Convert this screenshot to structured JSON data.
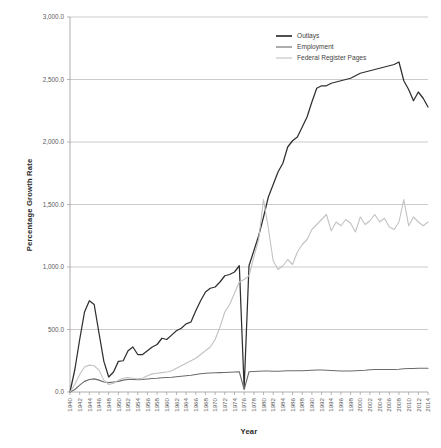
{
  "chart_data": {
    "type": "line",
    "title": "",
    "xlabel": "Year",
    "ylabel": "Percentage Growth Rate",
    "xlim": [
      1940,
      2014
    ],
    "ylim": [
      0,
      3000
    ],
    "grid": true,
    "legend_position": "top-center",
    "ytick_labels": [
      "0.0",
      "500.0",
      "1,000.0",
      "1,500.0",
      "2,000.0",
      "2,500.0",
      "3,000.0"
    ],
    "ytick_values": [
      0,
      500,
      1000,
      1500,
      2000,
      2500,
      3000
    ],
    "xtick_labels": [
      "1940",
      "1942",
      "1944",
      "1946",
      "1948",
      "1950",
      "1952",
      "1954",
      "1956",
      "1958",
      "1960",
      "1962",
      "1964",
      "1966",
      "1968",
      "1970",
      "1972",
      "1974",
      "1976",
      "1978",
      "1980",
      "1982",
      "1984",
      "1986",
      "1988",
      "1990",
      "1992",
      "1994",
      "1996",
      "1998",
      "2000",
      "2002",
      "2004",
      "2006",
      "2008",
      "2010",
      "2012",
      "2014"
    ],
    "x": [
      1940,
      1941,
      1942,
      1943,
      1944,
      1945,
      1946,
      1947,
      1948,
      1949,
      1950,
      1951,
      1952,
      1953,
      1954,
      1955,
      1956,
      1957,
      1958,
      1959,
      1960,
      1961,
      1962,
      1963,
      1964,
      1965,
      1966,
      1967,
      1968,
      1969,
      1970,
      1971,
      1972,
      1973,
      1974,
      1975,
      1976,
      1977,
      1978,
      1979,
      1980,
      1981,
      1982,
      1983,
      1984,
      1985,
      1986,
      1987,
      1988,
      1989,
      1990,
      1991,
      1992,
      1993,
      1994,
      1995,
      1996,
      1997,
      1998,
      1999,
      2000,
      2001,
      2002,
      2003,
      2004,
      2005,
      2006,
      2007,
      2008,
      2009,
      2010,
      2011,
      2012,
      2013,
      2014
    ],
    "series": [
      {
        "name": "Outlays",
        "color": "#2f2f2f",
        "width": 1.25,
        "values": [
          0,
          180,
          420,
          640,
          730,
          700,
          470,
          245,
          120,
          160,
          245,
          250,
          330,
          360,
          300,
          300,
          330,
          360,
          380,
          430,
          420,
          455,
          490,
          510,
          545,
          560,
          650,
          730,
          800,
          830,
          840,
          880,
          930,
          940,
          960,
          1010,
          30,
          1010,
          1130,
          1250,
          1400,
          1560,
          1660,
          1760,
          1830,
          1960,
          2010,
          2040,
          2120,
          2200,
          2320,
          2430,
          2450,
          2450,
          2470,
          2480,
          2490,
          2500,
          2510,
          2530,
          2550,
          2560,
          2570,
          2580,
          2590,
          2600,
          2610,
          2620,
          2640,
          2490,
          2420,
          2330,
          2400,
          2350,
          2280
        ]
      },
      {
        "name": "Employment",
        "color": "#6b6b6b",
        "width": 1.1,
        "values": [
          0,
          20,
          55,
          85,
          100,
          105,
          95,
          80,
          75,
          80,
          85,
          95,
          100,
          100,
          98,
          100,
          104,
          108,
          110,
          114,
          116,
          118,
          122,
          126,
          130,
          134,
          140,
          146,
          150,
          152,
          154,
          155,
          156,
          158,
          160,
          162,
          20,
          162,
          164,
          166,
          168,
          168,
          166,
          166,
          168,
          170,
          170,
          170,
          170,
          172,
          174,
          176,
          176,
          174,
          172,
          170,
          168,
          168,
          168,
          170,
          172,
          174,
          178,
          180,
          180,
          180,
          180,
          180,
          182,
          186,
          188,
          188,
          190,
          190,
          190
        ]
      },
      {
        "name": "Federal Register Pages",
        "color": "#c2c2c2",
        "width": 1.1,
        "values": [
          0,
          60,
          140,
          200,
          215,
          210,
          175,
          95,
          60,
          70,
          95,
          110,
          115,
          110,
          105,
          110,
          130,
          145,
          150,
          155,
          160,
          170,
          190,
          210,
          230,
          250,
          270,
          300,
          330,
          360,
          420,
          520,
          640,
          700,
          790,
          880,
          900,
          930,
          1080,
          1220,
          1540,
          1310,
          1050,
          980,
          1010,
          1060,
          1020,
          1120,
          1180,
          1220,
          1300,
          1340,
          1380,
          1420,
          1290,
          1360,
          1330,
          1380,
          1350,
          1280,
          1400,
          1340,
          1370,
          1420,
          1360,
          1390,
          1320,
          1300,
          1360,
          1540,
          1330,
          1400,
          1360,
          1330,
          1360
        ]
      }
    ]
  },
  "legend": {
    "items": [
      {
        "label": "Outlays"
      },
      {
        "label": "Employment"
      },
      {
        "label": "Federal Register Pages"
      }
    ]
  },
  "axes": {
    "y_title": "Percentage Growth Rate",
    "x_title": "Year"
  }
}
